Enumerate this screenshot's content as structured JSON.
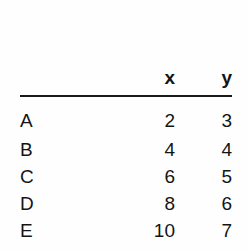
{
  "table": {
    "columns": [
      "",
      "x",
      "y"
    ],
    "row_header_label": "",
    "rows": [
      {
        "label": "A",
        "x": "2",
        "y": "3"
      },
      {
        "label": "B",
        "x": "4",
        "y": "4"
      },
      {
        "label": "C",
        "x": "6",
        "y": "5"
      },
      {
        "label": "D",
        "x": "8",
        "y": "6"
      },
      {
        "label": "E",
        "x": "10",
        "y": "7"
      }
    ]
  },
  "chart_data": {
    "type": "table",
    "title": "",
    "xlabel": "x",
    "ylabel": "y",
    "categories": [
      "A",
      "B",
      "C",
      "D",
      "E"
    ],
    "x": [
      2,
      4,
      6,
      8,
      10
    ],
    "series": [
      {
        "name": "y",
        "values": [
          3,
          4,
          5,
          6,
          7
        ]
      }
    ],
    "grid": false,
    "legend": "none"
  },
  "style": {
    "background": "#fefefe",
    "text_color": "#141414",
    "rule_color": "#1a1a1a"
  }
}
